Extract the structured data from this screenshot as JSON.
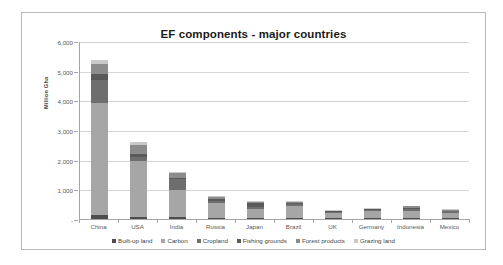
{
  "chart_data": {
    "type": "bar",
    "subtype": "stacked-bar",
    "title": "EF components - major countries",
    "xlabel": "",
    "ylabel": "Million Gha",
    "ylim": [
      0,
      6000
    ],
    "ytick_labels": [
      "-",
      "1,000",
      "2,000",
      "3,000",
      "4,000",
      "5,000",
      "6,000"
    ],
    "ytick_values": [
      0,
      1000,
      2000,
      3000,
      4000,
      5000,
      6000
    ],
    "grid": true,
    "legend_position": "bottom",
    "categories": [
      "China",
      "USA",
      "India",
      "Russia",
      "Japan",
      "Brazil",
      "UK",
      "Germany",
      "Indonesia",
      "Mexico"
    ],
    "series": [
      {
        "name": "Built-up land",
        "color": "#4d4d4d",
        "values": [
          150,
          60,
          70,
          25,
          20,
          30,
          10,
          12,
          18,
          12
        ]
      },
      {
        "name": "Carbon",
        "color": "#a6a6a6",
        "values": [
          3750,
          1900,
          900,
          530,
          330,
          420,
          190,
          250,
          250,
          180
        ]
      },
      {
        "name": "Cropland",
        "color": "#6e6e6e",
        "values": [
          800,
          130,
          380,
          60,
          70,
          55,
          30,
          35,
          80,
          55
        ]
      },
      {
        "name": "Fishing grounds",
        "color": "#5a5a5a",
        "values": [
          200,
          90,
          40,
          45,
          110,
          25,
          15,
          12,
          30,
          15
        ]
      },
      {
        "name": "Forest products",
        "color": "#8c8c8c",
        "values": [
          330,
          300,
          150,
          90,
          60,
          50,
          25,
          30,
          45,
          25
        ]
      },
      {
        "name": "Grazing land",
        "color": "#c9c9c9",
        "values": [
          120,
          120,
          60,
          30,
          20,
          25,
          15,
          15,
          20,
          25
        ]
      }
    ],
    "totals": [
      5350,
      2600,
      1600,
      780,
      610,
      605,
      285,
      354,
      443,
      312
    ]
  },
  "legend": {
    "items": [
      {
        "label": "Built-up land",
        "color": "#4d4d4d"
      },
      {
        "label": "Carbon",
        "color": "#a6a6a6"
      },
      {
        "label": "Cropland",
        "color": "#6e6e6e"
      },
      {
        "label": "Fishing grounds",
        "color": "#5a5a5a"
      },
      {
        "label": "Forest products",
        "color": "#8c8c8c"
      },
      {
        "label": "Grazing land",
        "color": "#c9c9c9"
      }
    ]
  },
  "colors": {
    "frame_border": "#b9b9b9",
    "gridline": "#d4d4d4",
    "axis_line": "#a6a6a6",
    "title_text": "#1a1a1a",
    "tick_text": "#595959",
    "background": "#ffffff"
  }
}
